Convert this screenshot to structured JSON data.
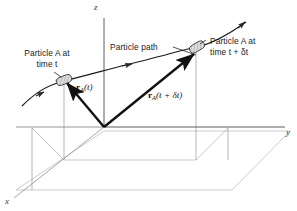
{
  "figure": {
    "name": "particle-position-vector-diagram",
    "background_color": "#ffffff",
    "line_color": "#1a1a1a",
    "construction_line_color": "#b0b0b0",
    "axis_color": "#4a4a4a",
    "marker_fill": "#d8d8d8"
  },
  "axes": {
    "z_label": "z",
    "y_label": "y",
    "x_label": "x"
  },
  "annotations": {
    "particle_path": "Particle path",
    "left_particle_line1": "Particle A at",
    "left_particle_line2": "time t",
    "right_particle_line1": "Particle A at",
    "right_particle_line2": "time t + δt"
  },
  "vectors": [
    {
      "id": "r-a-t",
      "symbol": "r",
      "subscript": "A",
      "argument": "(t)",
      "label_text": "rₐ(t)",
      "from": [
        104,
        127
      ],
      "to": [
        64,
        80
      ]
    },
    {
      "id": "r-a-t-plus-dt",
      "symbol": "r",
      "subscript": "A",
      "argument": "(t + δt)",
      "label_text": "rₐ(t + δt)",
      "from": [
        104,
        127
      ],
      "to": [
        196,
        52
      ]
    }
  ],
  "particles": [
    {
      "id": "particle-a-time-t",
      "position": [
        64,
        80
      ]
    },
    {
      "id": "particle-a-time-t-plus-dt",
      "position": [
        197,
        47
      ]
    }
  ]
}
